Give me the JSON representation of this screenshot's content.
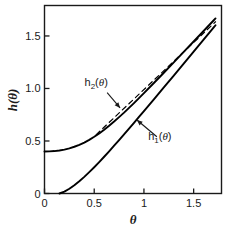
{
  "chart_data": {
    "type": "line",
    "title": "",
    "xlabel": "θ",
    "ylabel": "h(θ)",
    "xlim": [
      0,
      1.78
    ],
    "ylim": [
      0,
      1.79
    ],
    "grid": false,
    "legend_position": "inline-annotations",
    "xticks": [
      0,
      0.5,
      1,
      1.5
    ],
    "xtick_labels": [
      "0",
      "0.5",
      "1",
      "1.5"
    ],
    "yticks": [
      0,
      0.5,
      1.0,
      1.5
    ],
    "ytick_labels": [
      "0",
      "0.5",
      "1.0",
      "1.5"
    ],
    "series": [
      {
        "name": "h2(θ)",
        "label": "h₂(θ)",
        "style": "solid",
        "color": "#000000",
        "x": [
          0.0,
          0.05,
          0.1,
          0.15,
          0.2,
          0.25,
          0.3,
          0.35,
          0.4,
          0.45,
          0.5,
          0.55,
          0.6,
          0.65,
          0.7,
          0.75,
          0.8,
          0.85,
          0.9,
          0.95,
          1.0,
          1.1,
          1.2,
          1.3,
          1.4,
          1.5,
          1.6,
          1.7,
          1.72
        ],
        "y": [
          0.4,
          0.401,
          0.404,
          0.41,
          0.418,
          0.43,
          0.445,
          0.463,
          0.485,
          0.511,
          0.54,
          0.572,
          0.607,
          0.645,
          0.685,
          0.727,
          0.77,
          0.815,
          0.861,
          0.908,
          0.956,
          1.052,
          1.15,
          1.249,
          1.348,
          1.447,
          1.547,
          1.647,
          1.667
        ]
      },
      {
        "name": "h1(θ)",
        "label": "h₁(θ)",
        "style": "solid",
        "color": "#000000",
        "x": [
          0.15,
          0.2,
          0.25,
          0.3,
          0.35,
          0.4,
          0.45,
          0.5,
          0.55,
          0.6,
          0.65,
          0.7,
          0.75,
          0.8,
          0.85,
          0.9,
          0.95,
          1.0,
          1.1,
          1.2,
          1.3,
          1.4,
          1.5,
          1.6,
          1.7,
          1.72
        ],
        "y": [
          0.0,
          0.018,
          0.045,
          0.078,
          0.116,
          0.158,
          0.203,
          0.25,
          0.299,
          0.35,
          0.402,
          0.455,
          0.509,
          0.563,
          0.618,
          0.673,
          0.729,
          0.785,
          0.897,
          1.01,
          1.123,
          1.237,
          1.351,
          1.465,
          1.579,
          1.602
        ]
      },
      {
        "name": "asymptote",
        "label": "",
        "style": "dashed",
        "color": "#000000",
        "x": [
          0.52,
          1.72
        ],
        "y": [
          0.56,
          1.635
        ]
      }
    ],
    "annotations": [
      {
        "name": "h2-annotation",
        "text": "h₂(θ)",
        "text_x": 0.52,
        "text_y": 1.02,
        "arrow_from_x": 0.63,
        "arrow_from_y": 0.96,
        "arrow_to_x": 0.76,
        "arrow_to_y": 0.815
      },
      {
        "name": "h1-annotation",
        "text": "h₁(θ)",
        "text_x": 1.16,
        "text_y": 0.51,
        "arrow_from_x": 1.13,
        "arrow_from_y": 0.54,
        "arrow_to_x": 0.93,
        "arrow_to_y": 0.7
      }
    ]
  }
}
